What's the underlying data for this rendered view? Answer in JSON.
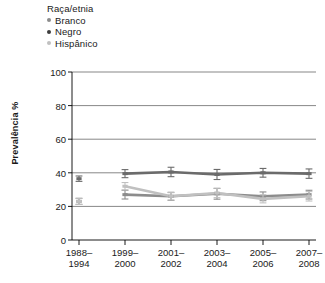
{
  "legend": {
    "title": "Raça/etnia",
    "items": [
      {
        "label": "Branco",
        "color": "#8c8c8c"
      },
      {
        "label": "Negro",
        "color": "#3d3d3d"
      },
      {
        "label": "Hispânico",
        "color": "#c0c0c0"
      }
    ]
  },
  "axes": {
    "ylabel": "Prevalência %",
    "yticks": [
      "100",
      "80",
      "60",
      "40",
      "20",
      "0"
    ],
    "xticks": [
      {
        "line1": "1988–",
        "line2": "1994"
      },
      {
        "line1": "1999–",
        "line2": "2000"
      },
      {
        "line1": "2001–",
        "line2": "2002"
      },
      {
        "line1": "2003–",
        "line2": "2004"
      },
      {
        "line1": "2005–",
        "line2": "2006"
      },
      {
        "line1": "2007–",
        "line2": "2008"
      }
    ]
  },
  "chart_data": {
    "type": "line",
    "title": "",
    "xlabel": "",
    "ylabel": "Prevalência %",
    "ylim": [
      0,
      100
    ],
    "ytick_values": [
      0,
      20,
      40,
      60,
      80,
      100
    ],
    "grid": true,
    "legend_position": "top-left",
    "error_bars": true,
    "categories": [
      "1988–1994",
      "1999–2000",
      "2001–2002",
      "2003–2004",
      "2005–2006",
      "2007–2008"
    ],
    "series": [
      {
        "name": "Branco",
        "color": "#8c8c8c",
        "values": [
          23.0,
          27.0,
          26.0,
          27.5,
          26.0,
          27.0
        ],
        "errors": [
          1.8,
          2.6,
          2.4,
          3.2,
          2.6,
          2.6
        ],
        "connected_from_index": 1
      },
      {
        "name": "Negro",
        "color": "#6b6b6b",
        "values": [
          36.5,
          39.5,
          40.5,
          39.0,
          40.0,
          39.5
        ],
        "errors": [
          1.6,
          2.4,
          2.8,
          3.0,
          2.6,
          2.8
        ],
        "connected_from_index": 1
      },
      {
        "name": "Hispânico",
        "color": "#c0c0c0",
        "values": [
          23.0,
          32.0,
          26.0,
          28.0,
          24.5,
          26.0
        ],
        "errors": [
          1.8,
          2.2,
          2.2,
          2.8,
          2.4,
          2.8
        ],
        "connected_from_index": 1
      }
    ]
  }
}
